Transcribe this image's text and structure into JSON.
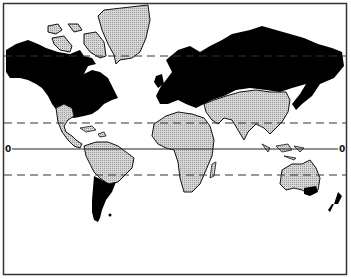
{
  "map": {
    "type": "world-map-mercator",
    "frame": {
      "x": 3,
      "y": 3,
      "width": 344,
      "height": 272
    },
    "colors": {
      "background": "#ffffff",
      "dark_region": "#000000",
      "light_region": "#c8c8c8",
      "outline": "#111111",
      "frame": "#333333"
    },
    "lines": [
      {
        "name": "arctic-circle",
        "style": "dashed",
        "y": 56
      },
      {
        "name": "tropic-of-cancer",
        "style": "dashed",
        "y": 123
      },
      {
        "name": "equator",
        "style": "solid",
        "y": 149
      },
      {
        "name": "tropic-of-capricorn",
        "style": "dashed",
        "y": 175
      }
    ],
    "equator_labels": {
      "left": "0",
      "right": "0"
    },
    "regions": {
      "dark": [
        "north-america-north",
        "europe-russia",
        "southern-south-america",
        "southeast-australia",
        "new-zealand"
      ],
      "light": [
        "greenland",
        "canadian-arctic-islands",
        "central-america",
        "caribbean",
        "northern-south-america",
        "africa",
        "middle-east",
        "south-asia",
        "east-asia",
        "southeast-asia",
        "australia"
      ]
    }
  }
}
